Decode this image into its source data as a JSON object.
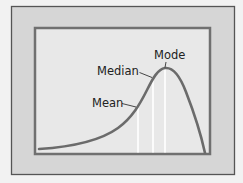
{
  "diagram": {
    "type": "skewed-distribution",
    "labels": {
      "mode": "Mode",
      "median": "Median",
      "mean": "Mean"
    },
    "order_left_to_right": [
      "Mean",
      "Median",
      "Mode"
    ],
    "colors": {
      "outer_background": "#d6d6d6",
      "panel_background": "#e8e8e8",
      "frame": "#6a6a6a",
      "curve": "#6b6b6b",
      "marker_lines": "#ffffff",
      "text": "#222222"
    }
  }
}
